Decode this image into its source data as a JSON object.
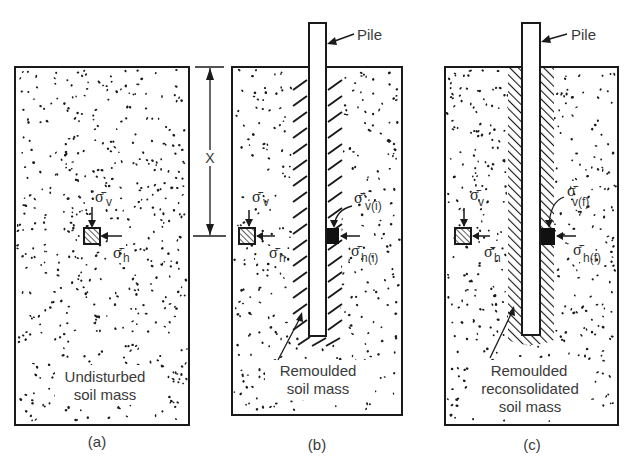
{
  "figure": {
    "panels": [
      {
        "id": "a",
        "caption": "(a)",
        "label_lines": [
          "Undisturbed",
          "soil mass"
        ],
        "has_pile": false,
        "zone": "none",
        "element": {
          "sigma_v": "σ̄",
          "sub_v": "v",
          "sigma_h": "σ̄",
          "sub_h": "h"
        }
      },
      {
        "id": "b",
        "caption": "(b)",
        "label_lines": [
          "Remoulded",
          "soil mass"
        ],
        "has_pile": true,
        "pile_label": "Pile",
        "zone": "remoulded",
        "element": {
          "sigma_v": "σ̄",
          "sub_v": "v",
          "sigma_h": "σ̄",
          "sub_h": "h"
        },
        "pile_element": {
          "sigma_v": "σ̄",
          "sub_v": "v(i)",
          "sigma_h": "σ̄",
          "sub_h": "h(i)"
        }
      },
      {
        "id": "c",
        "caption": "(c)",
        "label_lines": [
          "Remoulded",
          "reconsolidated",
          "soil mass"
        ],
        "has_pile": true,
        "pile_label": "Pile",
        "zone": "reconsolidated",
        "element": {
          "sigma_v": "σ̄",
          "sub_v": "v",
          "sigma_h": "σ̄",
          "sub_h": "h"
        },
        "pile_element": {
          "sigma_v": "σ̄",
          "sub_v": "v(f)",
          "sigma_h": "σ̄",
          "sub_h": "h(f)"
        }
      }
    ],
    "dimension_label": "X",
    "colors": {
      "ink": "#1a1a1a",
      "text": "#3a3a3a",
      "background": "#ffffff"
    }
  }
}
